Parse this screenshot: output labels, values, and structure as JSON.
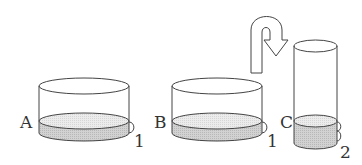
{
  "diagram": {
    "colors": {
      "stroke": "#444444",
      "liquid_top": "#e4e4e4",
      "liquid_side": "#c9c9c9",
      "background": "#ffffff"
    },
    "containers": [
      {
        "id": "A",
        "label": "A",
        "liquid_height_label": "1"
      },
      {
        "id": "B",
        "label": "B",
        "liquid_height_label": "1"
      },
      {
        "id": "C",
        "label": "C",
        "liquid_height_label": "2"
      }
    ],
    "arrow": {
      "icon": "u-turn-arrow-icon",
      "meaning": "pour from B into C"
    }
  }
}
